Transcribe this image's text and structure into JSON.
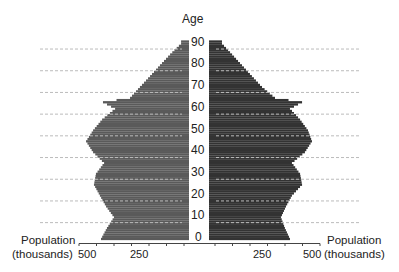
{
  "chart_data": {
    "type": "bar",
    "subtype": "population-pyramid",
    "title": "",
    "ylabel": "Age",
    "xlabel_left": "Population (thousands)",
    "xlabel_right": "Population (thousands)",
    "age_ticks": [
      0,
      10,
      20,
      30,
      40,
      50,
      60,
      70,
      80,
      90
    ],
    "x_tick_labels": [
      "500",
      "250",
      "250",
      "500"
    ],
    "xlim": [
      0,
      500
    ],
    "grid": "horizontal dashed at ages 8,18,...,88",
    "colors": {
      "left": "#5a5a5a",
      "right": "#333333",
      "grid": "#bbbbbb"
    },
    "ages": [
      0,
      5,
      10,
      15,
      20,
      25,
      30,
      35,
      40,
      45,
      50,
      55,
      60,
      63,
      65,
      70,
      75,
      80,
      85,
      90
    ],
    "series": [
      {
        "name": "left",
        "values": [
          400,
          373,
          341,
          377,
          405,
          432,
          423,
          386,
          436,
          468,
          436,
          395,
          336,
          391,
          268,
          223,
          177,
          132,
          86,
          36
        ]
      },
      {
        "name": "right",
        "values": [
          368,
          345,
          327,
          350,
          377,
          423,
          414,
          377,
          436,
          468,
          450,
          414,
          368,
          423,
          300,
          241,
          195,
          150,
          105,
          59
        ]
      }
    ]
  },
  "labels": {
    "age_title": "Age",
    "pop_left_1": "Population",
    "pop_left_2": "(thousands)",
    "pop_right_1": "Population",
    "pop_right_2": "(thousands)",
    "tick_500_left": "500",
    "tick_250_left": "250",
    "tick_250_right": "250",
    "tick_500_right": "500",
    "ages": [
      "90",
      "80",
      "70",
      "60",
      "50",
      "40",
      "30",
      "20",
      "10",
      "0"
    ]
  }
}
